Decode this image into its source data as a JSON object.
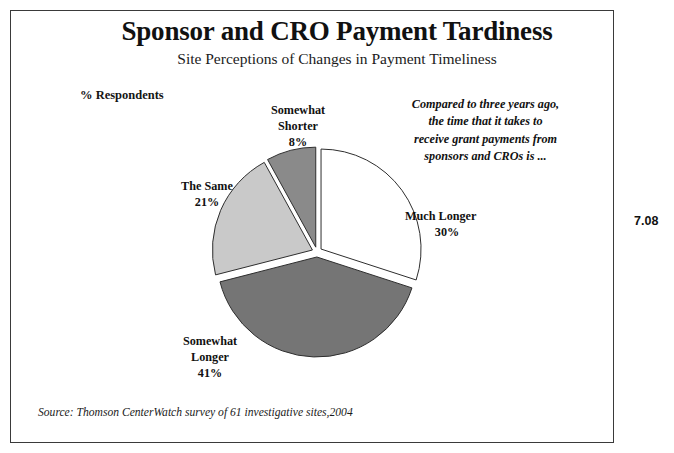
{
  "page": {
    "number": "7.08",
    "source_note": "Source:  Thomson CenterWatch survey of  61 investigative sites,2004"
  },
  "header": {
    "title": "Sponsor and CRO Payment Tardiness",
    "subtitle": "Site Perceptions of Changes in Payment Timeliness"
  },
  "axis_caption": "% Respondents",
  "annotation": {
    "line1": "Compared to three years ago,",
    "line2": "the time that it takes to",
    "line3": "receive grant payments from",
    "line4": "sponsors and CROs is ..."
  },
  "labels": {
    "shorter": {
      "l1": "Somewhat",
      "l2": "Shorter",
      "l3": "8%"
    },
    "same": {
      "l1": "The Same",
      "l2": "21%"
    },
    "much_longer": {
      "l1": "Much Longer",
      "l2": "30%"
    },
    "somewhat_longer": {
      "l1": "Somewhat",
      "l2": "Longer",
      "l3": "41%"
    }
  },
  "chart_data": {
    "type": "pie",
    "title": "Sponsor and CRO Payment Tardiness",
    "subtitle": "Site Perceptions of Changes in Payment Timeliness",
    "ylabel": "% Respondents",
    "units": "percent",
    "exploded": true,
    "start_angle_deg": 0,
    "direction": "clockwise",
    "center": [
      317,
      252
    ],
    "radius": 100,
    "categories": [
      "Much Longer",
      "Somewhat Longer",
      "The Same",
      "Somewhat Shorter"
    ],
    "values": [
      30,
      41,
      21,
      8
    ],
    "colors": [
      "#ffffff",
      "#757575",
      "#c9c9c9",
      "#8a8a8a"
    ],
    "slice_outline": "#2e2e2e",
    "legend": "none",
    "annotation": "Compared to three years ago, the time that it takes to receive grant payments from sponsors and CROs is ...",
    "source": "Thomson CenterWatch survey of 61 investigative sites, 2004"
  }
}
